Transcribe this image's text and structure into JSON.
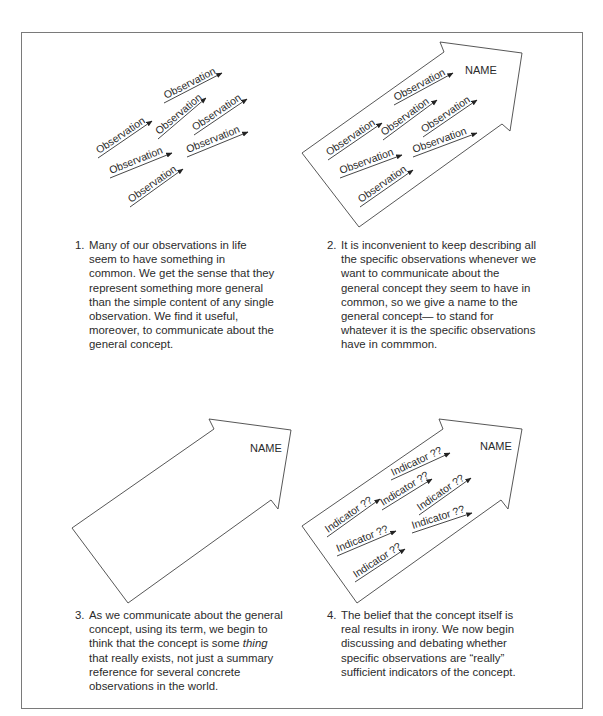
{
  "panels": [
    {
      "id": 1,
      "arrow_shape": false,
      "name_label": null,
      "item_label": "Observation",
      "item_count": 7,
      "caption": {
        "number": "1.",
        "text": "Many of our observations in life seem to have something in common. We get the sense that they represent something more general than the simple content of any single observation. We find it useful, moreover, to communicate about the general concept."
      }
    },
    {
      "id": 2,
      "arrow_shape": true,
      "name_label": "NAME",
      "item_label": "Observation",
      "item_count": 7,
      "caption": {
        "number": "2.",
        "text": "It is inconvenient to keep describing all the specific observations whenever we want to communicate about the general concept they seem to have in common, so we give a name to the general concept— to stand for whatever it is the specific observations have in commmon."
      }
    },
    {
      "id": 3,
      "arrow_shape": true,
      "name_label": "NAME",
      "item_label": null,
      "item_count": 0,
      "caption": {
        "number": "3.",
        "text_before": "As we communicate about the general concept, using its term, we begin to think that the concept is some ",
        "text_italic": "thing",
        "text_after": " that really exists, not just a summary reference for several concrete observations in the world."
      }
    },
    {
      "id": 4,
      "arrow_shape": true,
      "name_label": "NAME",
      "item_label": "Indicator ??",
      "item_count": 7,
      "caption": {
        "number": "4.",
        "text": "The belief that the concept itself is real results in irony. We now begin discussing and debating whether specific observations are “really” sufficient indicators of the concept."
      }
    }
  ],
  "colors": {
    "line": "#444444",
    "text": "#2b2b2b",
    "frame": "#7a7a7a",
    "background": "#ffffff"
  }
}
